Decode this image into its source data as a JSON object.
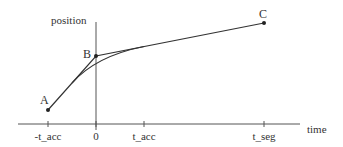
{
  "diagram": {
    "type": "trajectory-blending",
    "axes": {
      "y_label": "position",
      "x_label": "time",
      "ticks": [
        {
          "label": "-t_acc",
          "x": 48
        },
        {
          "label": "0",
          "x": 96
        },
        {
          "label": "t_acc",
          "x": 144
        },
        {
          "label": "t_seg",
          "x": 264
        }
      ]
    },
    "points": [
      {
        "label": "A",
        "x": 48,
        "y": 110
      },
      {
        "label": "B",
        "x": 96,
        "y": 56
      },
      {
        "label": "C",
        "x": 264,
        "y": 23
      }
    ],
    "curves": [
      {
        "name": "linear-path-A-B-C",
        "description": "Straight segments A to B to C"
      },
      {
        "name": "parabolic-blend",
        "description": "Smooth blend curve from -t_acc to t_acc"
      }
    ],
    "colors": {
      "line": "#333333",
      "axis": "#555555",
      "background": "#ffffff"
    }
  }
}
